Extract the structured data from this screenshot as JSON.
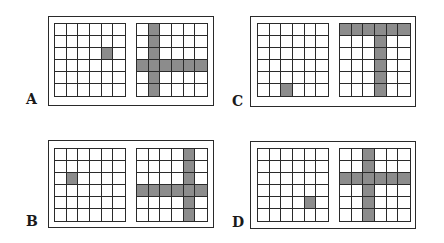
{
  "figure": {
    "grid_size": 6,
    "colors": {
      "shaded": "#8c8c8c",
      "line": "#2a2a2a",
      "background": "#ffffff"
    },
    "panels": [
      {
        "label": "A",
        "left_grid": {
          "shaded_cells": [
            [
              2,
              4
            ]
          ]
        },
        "right_grid": {
          "shaded_row": 3,
          "shaded_col": 1
        }
      },
      {
        "label": "B",
        "left_grid": {
          "shaded_cells": [
            [
              2,
              1
            ]
          ]
        },
        "right_grid": {
          "shaded_row": 3,
          "shaded_col": 4
        }
      },
      {
        "label": "C",
        "left_grid": {
          "shaded_cells": [
            [
              5,
              2
            ]
          ]
        },
        "right_grid": {
          "shaded_row": 0,
          "shaded_col": 3
        }
      },
      {
        "label": "D",
        "left_grid": {
          "shaded_cells": [
            [
              4,
              4
            ]
          ]
        },
        "right_grid": {
          "shaded_row": 2,
          "shaded_col": 2
        }
      }
    ]
  }
}
